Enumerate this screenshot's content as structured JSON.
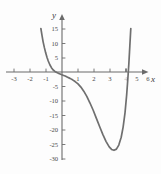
{
  "figure": {
    "name": "polynomial-graph",
    "y_axis_label": "y",
    "x_axis_label": "x"
  },
  "chart_data": {
    "type": "line",
    "title": "",
    "subtitle": "",
    "xlabel": "x",
    "ylabel": "y",
    "xlim": [
      -3.6,
      6.8
    ],
    "ylim": [
      -33,
      17
    ],
    "grid": false,
    "legend": null,
    "x_ticks": [
      -3,
      -2,
      -1,
      1,
      2,
      3,
      4,
      5,
      6
    ],
    "x_tick_labels": [
      "-3",
      "-2",
      "-1",
      "1",
      "2",
      "3",
      "4",
      "5",
      "6"
    ],
    "y_ticks": [
      15,
      10,
      5,
      -5,
      -10,
      -15,
      -20,
      -25,
      -30
    ],
    "y_tick_labels": [
      "15",
      "10",
      "5",
      "-5",
      "-10",
      "-15",
      "-20",
      "-25",
      "-30"
    ],
    "x_tick_hidden": [
      "4"
    ],
    "series": [
      {
        "name": "curve",
        "color": "#6f6f6f",
        "x": [
          -1.32,
          -1.25,
          -1.18,
          -1.1,
          -1.02,
          -0.94,
          -0.86,
          -0.76,
          -0.66,
          -0.55,
          -0.44,
          -0.32,
          -0.2,
          -0.08,
          0.06,
          0.2,
          0.35,
          0.5,
          0.66,
          0.82,
          1.0,
          1.18,
          1.36,
          1.55,
          1.75,
          1.95,
          2.15,
          2.35,
          2.55,
          2.75,
          2.95,
          3.1,
          3.25,
          3.4,
          3.55,
          3.7,
          3.82,
          3.94,
          4.04,
          4.12,
          4.18,
          4.24,
          4.3
        ],
        "y": [
          15.0,
          12.6,
          10.4,
          8.4,
          6.6,
          5.1,
          3.8,
          2.5,
          1.5,
          0.7,
          0.2,
          -0.2,
          -0.5,
          -0.8,
          -1.1,
          -1.4,
          -1.8,
          -2.2,
          -2.7,
          -3.3,
          -4.1,
          -5.2,
          -6.6,
          -8.4,
          -10.7,
          -13.2,
          -16.0,
          -18.8,
          -21.5,
          -23.9,
          -25.8,
          -26.7,
          -27.0,
          -26.6,
          -25.2,
          -22.5,
          -19.0,
          -14.0,
          -8.0,
          -2.0,
          3.0,
          9.0,
          15.0
        ],
        "minimum": {
          "x": 3.25,
          "y": -27.0
        },
        "x_intercepts": [
          -0.38,
          4.17
        ],
        "notes": "steep descent from upper left, shallow shoulder near x=1, deep minimum near (3.25,-27), steep rise to upper right"
      }
    ]
  }
}
